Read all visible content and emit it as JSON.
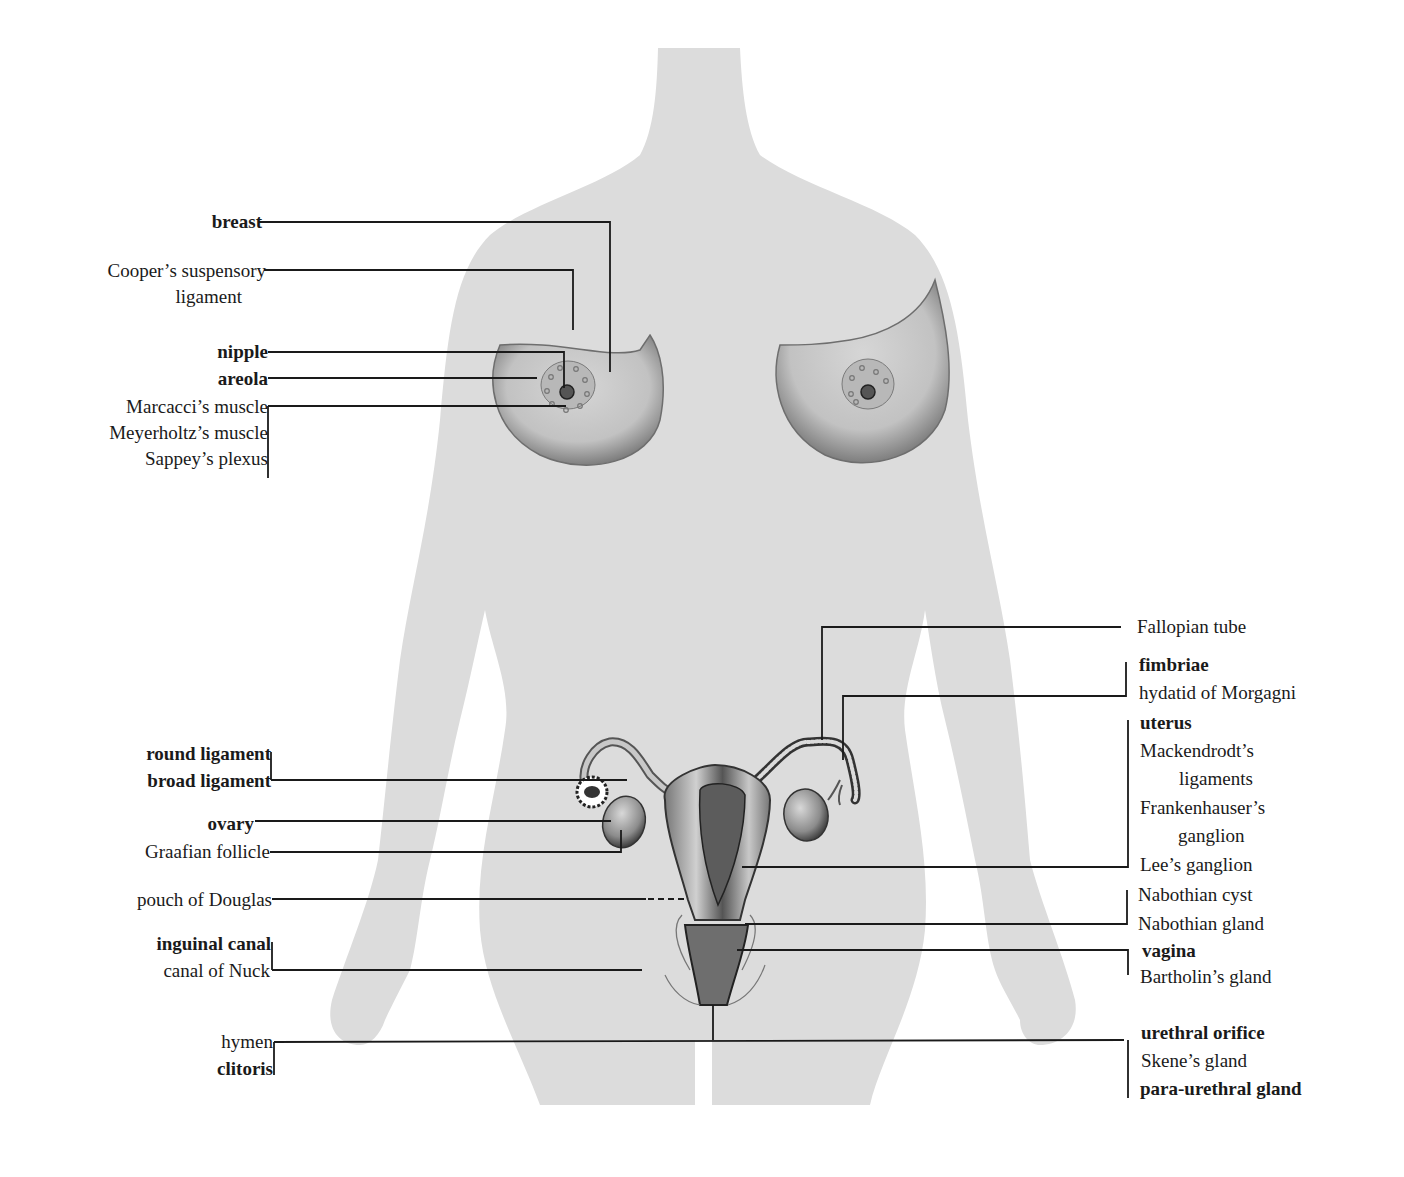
{
  "figure": {
    "title": "Female anatomy: breast and reproductive organs with eponymous structures",
    "colors": {
      "background": "#ffffff",
      "silhouette": "#dcdcdc",
      "organ_shade": "#8a8a8a",
      "leader_line": "#1a1a1a",
      "text": "#1a1a1a"
    }
  },
  "labels_left": [
    {
      "id": "breast",
      "text": "breast",
      "bold": true
    },
    {
      "id": "coopers-1",
      "text": "Cooper’s suspensory",
      "bold": false
    },
    {
      "id": "coopers-2",
      "text": "ligament",
      "bold": false
    },
    {
      "id": "nipple",
      "text": "nipple",
      "bold": true
    },
    {
      "id": "areola",
      "text": "areola",
      "bold": true
    },
    {
      "id": "marcacci",
      "text": "Marcacci’s muscle",
      "bold": false
    },
    {
      "id": "meyerholtz",
      "text": "Meyerholtz’s muscle",
      "bold": false
    },
    {
      "id": "sappey",
      "text": "Sappey’s plexus",
      "bold": false
    },
    {
      "id": "round-ligament",
      "text": "round ligament",
      "bold": true
    },
    {
      "id": "broad-ligament",
      "text": "broad ligament",
      "bold": true
    },
    {
      "id": "ovary",
      "text": "ovary",
      "bold": true
    },
    {
      "id": "graafian",
      "text": "Graafian follicle",
      "bold": false
    },
    {
      "id": "douglas",
      "text": "pouch of Douglas",
      "bold": false
    },
    {
      "id": "inguinal",
      "text": "inguinal canal",
      "bold": true
    },
    {
      "id": "nuck",
      "text": "canal of Nuck",
      "bold": false
    },
    {
      "id": "hymen",
      "text": "hymen",
      "bold": false
    },
    {
      "id": "clitoris",
      "text": "clitoris",
      "bold": true
    }
  ],
  "labels_right": [
    {
      "id": "fallopian",
      "text": "Fallopian tube",
      "bold": false
    },
    {
      "id": "fimbriae",
      "text": "fimbriae",
      "bold": true
    },
    {
      "id": "morgagni",
      "text": "hydatid of Morgagni",
      "bold": false
    },
    {
      "id": "uterus",
      "text": "uterus",
      "bold": true
    },
    {
      "id": "mackendrodt-1",
      "text": "Mackendrodt’s",
      "bold": false
    },
    {
      "id": "mackendrodt-2",
      "text": "ligaments",
      "bold": false
    },
    {
      "id": "frankenhauser-1",
      "text": "Frankenhauser’s",
      "bold": false
    },
    {
      "id": "frankenhauser-2",
      "text": "ganglion",
      "bold": false
    },
    {
      "id": "lee",
      "text": "Lee’s ganglion",
      "bold": false
    },
    {
      "id": "nabothian-cyst",
      "text": "Nabothian cyst",
      "bold": false
    },
    {
      "id": "nabothian-gland",
      "text": "Nabothian gland",
      "bold": false
    },
    {
      "id": "vagina",
      "text": "vagina",
      "bold": true
    },
    {
      "id": "bartholin",
      "text": "Bartholin’s gland",
      "bold": false
    },
    {
      "id": "urethral",
      "text": "urethral orifice",
      "bold": true
    },
    {
      "id": "skene",
      "text": "Skene’s gland",
      "bold": false
    },
    {
      "id": "paraurethral",
      "text": "para-urethral gland",
      "bold": true
    }
  ]
}
